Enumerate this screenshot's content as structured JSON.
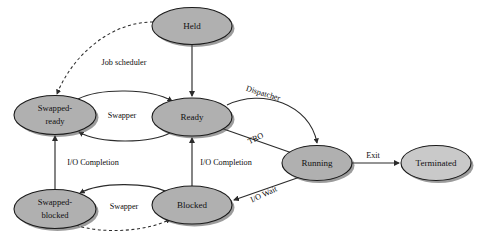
{
  "diagram": {
    "background_color": "#ffffff",
    "node_fill": "#b0b0b0",
    "node_fill_light": "#c9c9c9",
    "node_stroke": "#1a1a1a",
    "edge_color": "#2b2b2b",
    "nodes": [
      {
        "id": "held",
        "label": "Held",
        "line1": "Held",
        "line2": "",
        "cx": 192,
        "cy": 26,
        "rx": 40,
        "ry": 18.5,
        "fill": "#b0b0b0"
      },
      {
        "id": "swapped-ready",
        "label": "Swapped-ready",
        "line1": "Swapped-",
        "line2": "ready",
        "cx": 55,
        "cy": 115,
        "rx": 41,
        "ry": 19.5,
        "fill": "#b0b0b0"
      },
      {
        "id": "ready",
        "label": "Ready",
        "line1": "Ready",
        "line2": "",
        "cx": 192,
        "cy": 117,
        "rx": 40,
        "ry": 19,
        "fill": "#b0b0b0"
      },
      {
        "id": "running",
        "label": "Running",
        "line1": "Running",
        "line2": "",
        "cx": 317,
        "cy": 163,
        "rx": 35,
        "ry": 17.5,
        "fill": "#b0b0b0"
      },
      {
        "id": "terminated",
        "label": "Terminated",
        "line1": "Terminated",
        "line2": "",
        "cx": 436,
        "cy": 163,
        "rx": 35,
        "ry": 17.5,
        "fill": "#c9c9c9"
      },
      {
        "id": "swapped-blocked",
        "label": "Swapped-blocked",
        "line1": "Swapped-",
        "line2": "blocked",
        "cx": 55,
        "cy": 209,
        "rx": 41,
        "ry": 19.5,
        "fill": "#b0b0b0"
      },
      {
        "id": "blocked",
        "label": "Blocked",
        "line1": "Blocked",
        "line2": "",
        "cx": 192,
        "cy": 205,
        "rx": 40,
        "ry": 19,
        "fill": "#b0b0b0"
      }
    ],
    "edges": [
      {
        "id": "held-to-swapped-ready",
        "from": "held",
        "to": "swapped-ready",
        "label": "Job scheduler",
        "style": "dashed",
        "label_x": 124,
        "label_y": 63,
        "label_rotation": 0
      },
      {
        "id": "held-to-ready",
        "from": "held",
        "to": "ready",
        "label": "",
        "style": "solid",
        "label_x": 0,
        "label_y": 0,
        "label_rotation": 0
      },
      {
        "id": "swapped-ready-to-ready",
        "from": "swapped-ready",
        "to": "ready",
        "label": "Swapper",
        "style": "solid",
        "label_x": 122,
        "label_y": 116,
        "label_rotation": 0
      },
      {
        "id": "ready-to-swapped-ready",
        "from": "ready",
        "to": "swapped-ready",
        "label": "",
        "style": "solid",
        "label_x": 0,
        "label_y": 0,
        "label_rotation": 0
      },
      {
        "id": "ready-to-running",
        "from": "ready",
        "to": "running",
        "label": "Dispatcher",
        "style": "solid",
        "label_x": 263,
        "label_y": 94,
        "label_rotation": 17
      },
      {
        "id": "running-to-ready",
        "from": "running",
        "to": "ready",
        "label": "TRO",
        "style": "solid",
        "label_x": 256,
        "label_y": 139,
        "label_rotation": -26
      },
      {
        "id": "running-to-terminated",
        "from": "running",
        "to": "terminated",
        "label": "Exit",
        "style": "solid",
        "label_x": 373,
        "label_y": 156,
        "label_rotation": 0
      },
      {
        "id": "running-to-blocked",
        "from": "running",
        "to": "blocked",
        "label": "I/O Wait",
        "style": "solid",
        "label_x": 264,
        "label_y": 195,
        "label_rotation": -25
      },
      {
        "id": "swapped-blocked-to-swapped-ready",
        "from": "swapped-blocked",
        "to": "swapped-ready",
        "label": "I/O Completion",
        "style": "solid",
        "label_x": 93,
        "label_y": 163,
        "label_rotation": 0
      },
      {
        "id": "blocked-to-ready",
        "from": "blocked",
        "to": "ready",
        "label": "I/O Completion",
        "style": "solid",
        "label_x": 226,
        "label_y": 163,
        "label_rotation": 0
      },
      {
        "id": "blocked-to-swapped-blocked",
        "from": "blocked",
        "to": "swapped-blocked",
        "label": "Swapper",
        "style": "solid",
        "label_x": 124,
        "label_y": 207,
        "label_rotation": 0
      },
      {
        "id": "swapped-blocked-to-blocked",
        "from": "swapped-blocked",
        "to": "blocked",
        "label": "",
        "style": "dashed",
        "label_x": 0,
        "label_y": 0,
        "label_rotation": 0
      }
    ]
  }
}
